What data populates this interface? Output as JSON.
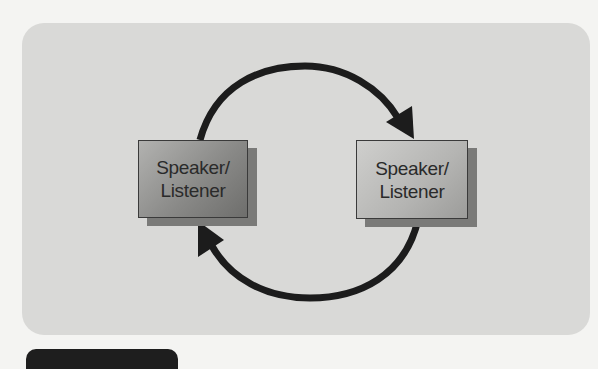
{
  "diagram": {
    "nodes": [
      {
        "id": "left",
        "label_line1": "Speaker/",
        "label_line2": "Listener"
      },
      {
        "id": "right",
        "label_line1": "Speaker/",
        "label_line2": "Listener"
      }
    ],
    "edges": [
      {
        "from": "left",
        "to": "right",
        "shape": "arc-top",
        "arrow": "arrow-icon"
      },
      {
        "from": "right",
        "to": "left",
        "shape": "arc-bottom",
        "arrow": "arrow-icon"
      }
    ],
    "colors": {
      "panel": "#d9d9d7",
      "arrow": "#1c1c1c",
      "left_box": "#8a8a88",
      "right_box": "#b4b4b2"
    }
  }
}
